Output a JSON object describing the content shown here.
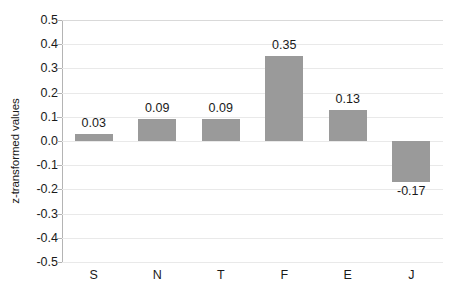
{
  "chart_data": {
    "type": "bar",
    "title": "",
    "xlabel": "",
    "ylabel": "z-transformed values",
    "categories": [
      "S",
      "N",
      "T",
      "F",
      "E",
      "J"
    ],
    "values": [
      0.03,
      0.09,
      0.09,
      0.35,
      0.13,
      -0.17
    ],
    "value_labels": [
      "0.03",
      "0.09",
      "0.09",
      "0.35",
      "0.13",
      "-0.17"
    ],
    "ylim": [
      -0.5,
      0.5
    ],
    "ytick_values": [
      0.5,
      0.4,
      0.3,
      0.2,
      0.1,
      0.0,
      -0.1,
      -0.2,
      -0.3,
      -0.4,
      -0.5
    ],
    "ytick_labels": [
      "0.5",
      "0.4",
      "0.3",
      "0.2",
      "0.1",
      "0.0",
      "-0.1",
      "-0.2",
      "-0.3",
      "-0.4",
      "-0.5"
    ],
    "grid": true,
    "legend": false,
    "legend_position": "none",
    "series": [
      {
        "name": "z-transformed values",
        "values": [
          0.03,
          0.09,
          0.09,
          0.35,
          0.13,
          -0.17
        ],
        "color": "#9a9a9a"
      }
    ],
    "colors": {
      "bar_fill": "#9a9a9a",
      "gridline": "#e9e9e9",
      "axis_line": "#b4b4b4",
      "text": "#1a1a1a",
      "background": "#ffffff"
    }
  }
}
